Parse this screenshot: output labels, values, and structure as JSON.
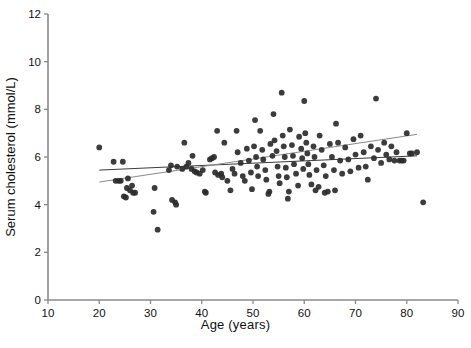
{
  "chart_data": {
    "type": "scatter",
    "title": "",
    "xlabel": "Age (years)",
    "ylabel": "Serum cholesterol  (mmol/L)",
    "xlim": [
      10,
      90
    ],
    "ylim": [
      0,
      12
    ],
    "xticks": [
      10,
      20,
      30,
      40,
      50,
      60,
      70,
      80,
      90
    ],
    "yticks": [
      0,
      2,
      4,
      6,
      8,
      10,
      12
    ],
    "grid": false,
    "legend": "none",
    "marker_color": "#2b2b2b",
    "marker_size": 4.2,
    "axis_color": "#8a8a8a",
    "points": [
      [
        20.0,
        6.4
      ],
      [
        22.8,
        5.8
      ],
      [
        24.6,
        5.8
      ],
      [
        23.2,
        5.0
      ],
      [
        23.8,
        5.0
      ],
      [
        24.2,
        5.0
      ],
      [
        25.6,
        5.1
      ],
      [
        25.4,
        4.7
      ],
      [
        26.0,
        4.6
      ],
      [
        26.4,
        4.8
      ],
      [
        26.6,
        4.5
      ],
      [
        27.0,
        4.5
      ],
      [
        24.8,
        4.35
      ],
      [
        25.2,
        4.3
      ],
      [
        30.8,
        4.7
      ],
      [
        30.6,
        3.7
      ],
      [
        31.4,
        2.95
      ],
      [
        34.2,
        4.2
      ],
      [
        34.8,
        4.1
      ],
      [
        35.0,
        4.0
      ],
      [
        34.0,
        5.65
      ],
      [
        35.2,
        5.6
      ],
      [
        36.2,
        5.5
      ],
      [
        37.0,
        5.6
      ],
      [
        37.4,
        5.75
      ],
      [
        38.2,
        6.05
      ],
      [
        38.6,
        5.4
      ],
      [
        39.0,
        5.35
      ],
      [
        38.0,
        5.5
      ],
      [
        39.6,
        5.3
      ],
      [
        40.2,
        5.45
      ],
      [
        40.6,
        4.55
      ],
      [
        40.8,
        4.5
      ],
      [
        41.6,
        5.9
      ],
      [
        42.0,
        5.95
      ],
      [
        42.4,
        6.0
      ],
      [
        42.6,
        5.35
      ],
      [
        43.2,
        5.25
      ],
      [
        43.8,
        5.3
      ],
      [
        44.4,
        6.6
      ],
      [
        44.0,
        5.15
      ],
      [
        45.0,
        5.0
      ],
      [
        45.6,
        4.6
      ],
      [
        46.0,
        5.5
      ],
      [
        46.4,
        5.3
      ],
      [
        47.0,
        6.2
      ],
      [
        47.6,
        5.75
      ],
      [
        48.0,
        5.2
      ],
      [
        48.4,
        5.0
      ],
      [
        48.8,
        6.35
      ],
      [
        49.2,
        5.85
      ],
      [
        49.6,
        5.35
      ],
      [
        49.8,
        4.65
      ],
      [
        50.2,
        6.45
      ],
      [
        50.6,
        6.0
      ],
      [
        50.8,
        5.6
      ],
      [
        51.0,
        5.2
      ],
      [
        51.4,
        7.1
      ],
      [
        51.8,
        6.3
      ],
      [
        52.0,
        5.9
      ],
      [
        52.4,
        5.45
      ],
      [
        52.6,
        5.05
      ],
      [
        53.0,
        4.45
      ],
      [
        53.4,
        6.55
      ],
      [
        53.8,
        6.05
      ],
      [
        54.0,
        7.8
      ],
      [
        54.2,
        6.7
      ],
      [
        54.6,
        6.25
      ],
      [
        54.8,
        5.6
      ],
      [
        55.0,
        5.2
      ],
      [
        55.2,
        4.9
      ],
      [
        55.6,
        8.7
      ],
      [
        55.8,
        6.9
      ],
      [
        56.0,
        6.45
      ],
      [
        56.2,
        6.0
      ],
      [
        56.4,
        5.55
      ],
      [
        56.6,
        5.15
      ],
      [
        56.8,
        4.25
      ],
      [
        57.2,
        7.15
      ],
      [
        57.6,
        6.5
      ],
      [
        57.8,
        6.05
      ],
      [
        58.0,
        5.7
      ],
      [
        58.4,
        5.3
      ],
      [
        58.8,
        4.8
      ],
      [
        59.0,
        6.85
      ],
      [
        59.4,
        6.35
      ],
      [
        59.6,
        5.95
      ],
      [
        59.8,
        5.5
      ],
      [
        60.0,
        8.35
      ],
      [
        60.2,
        7.0
      ],
      [
        60.4,
        6.6
      ],
      [
        60.6,
        6.15
      ],
      [
        60.8,
        5.7
      ],
      [
        61.0,
        5.25
      ],
      [
        61.4,
        4.85
      ],
      [
        61.8,
        6.45
      ],
      [
        62.0,
        6.0
      ],
      [
        62.4,
        5.45
      ],
      [
        62.8,
        4.75
      ],
      [
        63.0,
        6.9
      ],
      [
        63.4,
        6.3
      ],
      [
        63.8,
        5.65
      ],
      [
        64.2,
        5.2
      ],
      [
        64.6,
        4.55
      ],
      [
        65.0,
        6.55
      ],
      [
        65.4,
        6.0
      ],
      [
        65.8,
        5.45
      ],
      [
        66.2,
        7.4
      ],
      [
        66.6,
        6.6
      ],
      [
        67.0,
        5.85
      ],
      [
        67.4,
        5.3
      ],
      [
        68.0,
        6.4
      ],
      [
        68.6,
        5.9
      ],
      [
        69.0,
        5.4
      ],
      [
        69.6,
        6.75
      ],
      [
        70.0,
        6.1
      ],
      [
        70.6,
        5.55
      ],
      [
        71.0,
        6.9
      ],
      [
        71.6,
        6.2
      ],
      [
        72.0,
        5.6
      ],
      [
        72.4,
        5.05
      ],
      [
        73.0,
        6.45
      ],
      [
        73.6,
        5.95
      ],
      [
        74.0,
        8.45
      ],
      [
        74.4,
        6.3
      ],
      [
        75.0,
        5.75
      ],
      [
        75.6,
        6.6
      ],
      [
        76.0,
        6.1
      ],
      [
        76.6,
        5.9
      ],
      [
        77.0,
        6.45
      ],
      [
        77.6,
        5.85
      ],
      [
        78.0,
        6.2
      ],
      [
        78.6,
        5.85
      ],
      [
        79.0,
        5.85
      ],
      [
        79.4,
        5.85
      ],
      [
        80.0,
        7.0
      ],
      [
        80.6,
        6.15
      ],
      [
        81.0,
        6.15
      ],
      [
        82.0,
        6.2
      ],
      [
        83.2,
        4.1
      ],
      [
        43.0,
        7.1
      ],
      [
        46.8,
        7.1
      ],
      [
        50.4,
        7.55
      ],
      [
        36.6,
        6.6
      ],
      [
        33.6,
        5.45
      ],
      [
        62.2,
        4.6
      ],
      [
        57.0,
        4.55
      ],
      [
        64.0,
        4.5
      ],
      [
        66.0,
        4.6
      ],
      [
        53.2,
        4.55
      ]
    ],
    "trendlines": [
      {
        "name": "flat-trend",
        "color": "#3c3c3c",
        "x0": 20.0,
        "y0": 5.45,
        "x1": 82.0,
        "y1": 6.05,
        "width": 1.0
      },
      {
        "name": "steep-trend",
        "color": "#8a8a8a",
        "x0": 20.0,
        "y0": 4.95,
        "x1": 82.0,
        "y1": 6.95,
        "width": 1.0
      }
    ]
  }
}
